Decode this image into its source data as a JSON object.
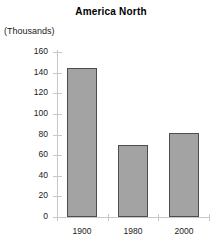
{
  "chart_data": {
    "type": "bar",
    "title": "America North",
    "units_label": "(Thousands)",
    "xlabel": "",
    "ylabel": "",
    "categories": [
      "1900",
      "1980",
      "2000"
    ],
    "values": [
      144,
      70,
      81
    ],
    "series": [
      {
        "name": "America North",
        "values": [
          144,
          70,
          81
        ]
      }
    ],
    "ylim": [
      0,
      160
    ],
    "ytick_values": [
      0,
      20,
      40,
      60,
      80,
      100,
      120,
      140,
      160
    ],
    "ytick_labels": [
      "0",
      "20",
      "40",
      "60",
      "80",
      "100",
      "120",
      "140",
      "160"
    ],
    "grid": false,
    "legend": "none",
    "bar_fill_color": "#a3a3a3",
    "bar_border_color": "#4d4d4d",
    "axis_color": "#c8c8c8",
    "background_color": "#ffffff",
    "text_color": "#000000"
  }
}
